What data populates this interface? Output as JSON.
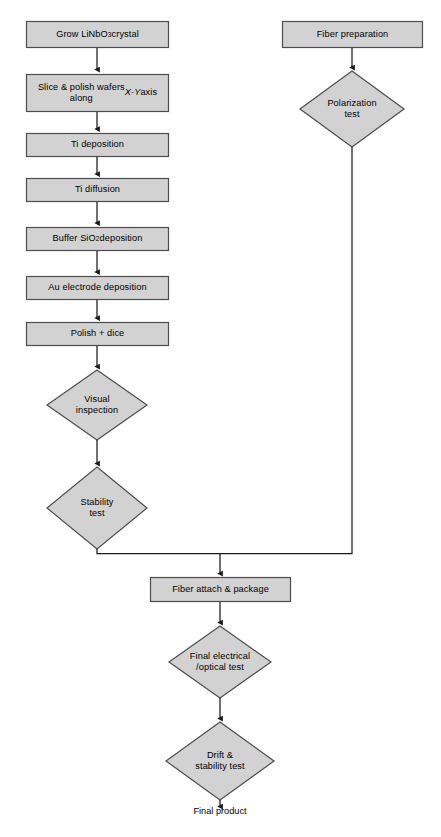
{
  "diagram": {
    "colors": {
      "node_fill": "#d2d2d2",
      "node_stroke": "#4d4d4d",
      "connector": "#1a1a1a",
      "background": "#ffffff",
      "text": "#000000"
    },
    "nodes": [
      {
        "id": "grow-crystal",
        "shape": "process",
        "label": "Grow LiNbO3 crystal",
        "label_html": "Grow LiNbO<sub>3</sub> crystal",
        "x": 26,
        "y": 21,
        "w": 143,
        "h": 27
      },
      {
        "id": "slice-polish",
        "shape": "process",
        "label": "Slice & polish wafers along X-Y axis",
        "label_html": "Slice &amp; polish wafers<br>along <span class=\"ital\">X-Y</span> axis",
        "x": 26,
        "y": 74,
        "w": 143,
        "h": 38
      },
      {
        "id": "ti-deposition",
        "shape": "process",
        "label": "Ti deposition",
        "label_html": "Ti deposition",
        "x": 26,
        "y": 133,
        "w": 143,
        "h": 24
      },
      {
        "id": "ti-diffusion",
        "shape": "process",
        "label": "Ti diffusion",
        "label_html": "Ti diffusion",
        "x": 26,
        "y": 178,
        "w": 143,
        "h": 24
      },
      {
        "id": "buffer-sio2",
        "shape": "process",
        "label": "Buffer SiO2 deposition",
        "label_html": "Buffer SiO<sub>2</sub> deposition",
        "x": 26,
        "y": 227,
        "w": 143,
        "h": 24
      },
      {
        "id": "au-electrode",
        "shape": "process",
        "label": "Au electrode deposition",
        "label_html": "Au electrode deposition",
        "x": 26,
        "y": 276,
        "w": 143,
        "h": 24
      },
      {
        "id": "polish-dice",
        "shape": "process",
        "label": "Polish + dice",
        "label_html": "Polish + dice",
        "x": 26,
        "y": 322,
        "w": 143,
        "h": 24
      },
      {
        "id": "visual-inspection",
        "shape": "decision",
        "label": "Visual inspection",
        "label_html": "Visual<br>inspection",
        "cx": 97,
        "cy": 405,
        "rx": 50,
        "ry": 35
      },
      {
        "id": "stability-test",
        "shape": "decision",
        "label": "Stability test",
        "label_html": "Stability<br>test",
        "cx": 97,
        "cy": 508,
        "rx": 50,
        "ry": 41
      },
      {
        "id": "fiber-preparation",
        "shape": "process",
        "label": "Fiber preparation",
        "label_html": "Fiber preparation",
        "x": 282,
        "y": 21,
        "w": 141,
        "h": 27
      },
      {
        "id": "polarization-test",
        "shape": "decision",
        "label": "Polarization test",
        "label_html": "Polarization<br>test",
        "cx": 352,
        "cy": 109,
        "rx": 52,
        "ry": 38
      },
      {
        "id": "fiber-attach",
        "shape": "process",
        "label": "Fiber attach & package",
        "label_html": "Fiber attach &amp; package",
        "x": 150,
        "y": 577,
        "w": 141,
        "h": 25
      },
      {
        "id": "final-electrical-optical-test",
        "shape": "decision",
        "label": "Final electrical /optical test",
        "label_html": "Final electrical<br>/optical test",
        "cx": 220,
        "cy": 662,
        "rx": 51,
        "ry": 36
      },
      {
        "id": "drift-stability-test",
        "shape": "decision",
        "label": "Drift & stability test",
        "label_html": "Drift &amp;<br>stability test",
        "cx": 220,
        "cy": 761,
        "rx": 54,
        "ry": 39
      }
    ],
    "terminal_label": {
      "id": "final-product",
      "text": "Final product",
      "x": 220,
      "y": 810
    },
    "connectors": [
      {
        "from": "grow-crystal",
        "to": "slice-polish",
        "type": "arrow"
      },
      {
        "from": "slice-polish",
        "to": "ti-deposition",
        "type": "arrow"
      },
      {
        "from": "ti-deposition",
        "to": "ti-diffusion",
        "type": "arrow"
      },
      {
        "from": "ti-diffusion",
        "to": "buffer-sio2",
        "type": "arrow"
      },
      {
        "from": "buffer-sio2",
        "to": "au-electrode",
        "type": "arrow"
      },
      {
        "from": "au-electrode",
        "to": "polish-dice",
        "type": "arrow"
      },
      {
        "from": "polish-dice",
        "to": "visual-inspection",
        "type": "arrow"
      },
      {
        "from": "visual-inspection",
        "to": "stability-test",
        "type": "arrow"
      },
      {
        "from": "stability-test",
        "to": "fiber-attach",
        "type": "elbow-arrow"
      },
      {
        "from": "fiber-preparation",
        "to": "polarization-test",
        "type": "arrow"
      },
      {
        "from": "polarization-test",
        "to": "fiber-attach",
        "type": "elbow-arrow"
      },
      {
        "from": "fiber-attach",
        "to": "final-electrical-optical-test",
        "type": "arrow"
      },
      {
        "from": "final-electrical-optical-test",
        "to": "drift-stability-test",
        "type": "arrow"
      },
      {
        "from": "drift-stability-test",
        "to": "final-product",
        "type": "arrow"
      }
    ]
  }
}
